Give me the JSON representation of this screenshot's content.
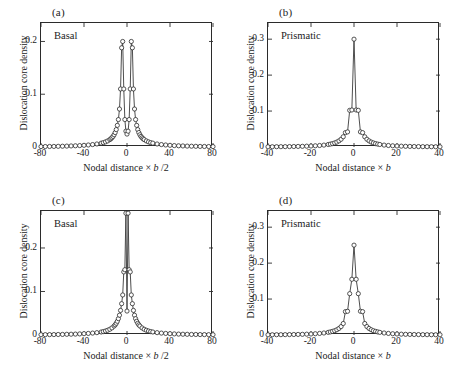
{
  "figure": {
    "background": "#ffffff",
    "line_color": "#3a3a3a",
    "marker_edge_color": "#2b2b2b",
    "marker_face_color": "#ffffff",
    "axis_color": "#2b2b2b"
  },
  "panels": [
    {
      "tag": "(a)",
      "inset_label": "Basal",
      "xlabel_prefix": "Nodal distance",
      "xlabel_times": "×",
      "xlabel_var": "b",
      "xlabel_suffix": "/2",
      "ylabel": "Dislocation core density",
      "xticks": [
        "-80",
        "-40",
        "0",
        "40",
        "80"
      ],
      "yticks": [
        "0",
        "0.1",
        "0.2"
      ]
    },
    {
      "tag": "(b)",
      "inset_label": "Prismatic",
      "xlabel_prefix": "Nodal distance",
      "xlabel_times": "×",
      "xlabel_var": "b",
      "xlabel_suffix": "",
      "ylabel": "Dislocation core density",
      "xticks": [
        "-40",
        "-20",
        "0",
        "20",
        "40"
      ],
      "yticks": [
        "0",
        "0.1",
        "0.2",
        "0.3"
      ]
    },
    {
      "tag": "(c)",
      "inset_label": "Basal",
      "xlabel_prefix": "Nodal distance",
      "xlabel_times": "×",
      "xlabel_var": "b",
      "xlabel_suffix": "/2",
      "ylabel": "Dislocation core density",
      "xticks": [
        "-80",
        "-40",
        "0",
        "40",
        "80"
      ],
      "yticks": [
        "0",
        "0.1",
        "0.2"
      ]
    },
    {
      "tag": "(d)",
      "inset_label": "Prismatic",
      "xlabel_prefix": "Nodal distance",
      "xlabel_times": "×",
      "xlabel_var": "b",
      "xlabel_suffix": "",
      "ylabel": "Dislocation core density",
      "xticks": [
        "-40",
        "-20",
        "0",
        "20",
        "40"
      ],
      "yticks": [
        "0",
        "0.1",
        "0.2",
        "0.3"
      ]
    }
  ],
  "caption_partial": "",
  "chart_data": [
    {
      "type": "line",
      "panel": "(a)",
      "title": "Basal",
      "xlabel": "Nodal distance × b /2",
      "ylabel": "Dislocation core density",
      "xlim": [
        -80,
        80
      ],
      "ylim": [
        0,
        0.235
      ],
      "xticks": [
        -80,
        -40,
        0,
        40,
        80
      ],
      "yticks": [
        0,
        0.1,
        0.2
      ],
      "grid": false,
      "legend": "none",
      "markers": "open-circle",
      "description": "Symmetric twin peaks near x = -5 and x = +5, each rising to about 0.20, with a shallow local minimum of about 0.025 at x = 0 and long flat tails near zero.",
      "x": [
        -80,
        -76,
        -72,
        -68,
        -64,
        -60,
        -56,
        -52,
        -48,
        -44,
        -40,
        -36,
        -32,
        -28,
        -24,
        -22,
        -20,
        -18,
        -16,
        -15,
        -14,
        -13,
        -12,
        -11,
        -10,
        -9,
        -8,
        -7,
        -6,
        -5,
        -4,
        -3,
        -2,
        -1,
        0,
        1,
        2,
        3,
        4,
        5,
        6,
        7,
        8,
        9,
        10,
        11,
        12,
        13,
        14,
        15,
        16,
        18,
        20,
        22,
        24,
        28,
        32,
        36,
        40,
        44,
        48,
        52,
        56,
        60,
        64,
        68,
        72,
        76,
        80
      ],
      "y": [
        0.0008,
        0.0009,
        0.001,
        0.0011,
        0.0013,
        0.0015,
        0.0017,
        0.002,
        0.0023,
        0.0027,
        0.0032,
        0.0038,
        0.0046,
        0.0057,
        0.0073,
        0.0083,
        0.0097,
        0.0115,
        0.014,
        0.0156,
        0.0176,
        0.02,
        0.0232,
        0.0274,
        0.033,
        0.041,
        0.052,
        0.072,
        0.11,
        0.188,
        0.2,
        0.11,
        0.052,
        0.03,
        0.0245,
        0.03,
        0.052,
        0.11,
        0.2,
        0.188,
        0.11,
        0.072,
        0.052,
        0.041,
        0.033,
        0.0274,
        0.0232,
        0.02,
        0.0176,
        0.0156,
        0.014,
        0.0115,
        0.0097,
        0.0083,
        0.0073,
        0.0057,
        0.0046,
        0.0038,
        0.0032,
        0.0027,
        0.0023,
        0.002,
        0.0017,
        0.0015,
        0.0013,
        0.0011,
        0.001,
        0.0009,
        0.0008
      ]
    },
    {
      "type": "line",
      "panel": "(b)",
      "title": "Prismatic",
      "xlabel": "Nodal distance × b",
      "ylabel": "Dislocation core density",
      "xlim": [
        -40,
        40
      ],
      "ylim": [
        0,
        0.345
      ],
      "xticks": [
        -40,
        -20,
        0,
        20,
        40
      ],
      "yticks": [
        0,
        0.1,
        0.2,
        0.3
      ],
      "grid": false,
      "legend": "none",
      "markers": "open-circle",
      "description": "Single very sharp symmetric peak centred at x = 0 reaching about 0.30 at the apex with paired markers near 0.275, dropping to about 0.10 at x = ±1 and long flat tails near zero.",
      "x": [
        -40,
        -38,
        -36,
        -34,
        -32,
        -30,
        -28,
        -26,
        -24,
        -22,
        -20,
        -18,
        -16,
        -14,
        -12,
        -11,
        -10,
        -9,
        -8,
        -7,
        -6,
        -5,
        -4,
        -3,
        -2,
        -1,
        0,
        1,
        2,
        3,
        4,
        5,
        6,
        7,
        8,
        9,
        10,
        11,
        12,
        14,
        16,
        18,
        20,
        22,
        24,
        26,
        28,
        30,
        32,
        34,
        36,
        38,
        40
      ],
      "y": [
        0.0006,
        0.0007,
        0.0008,
        0.0009,
        0.001,
        0.0012,
        0.0014,
        0.0016,
        0.0019,
        0.0023,
        0.0028,
        0.0034,
        0.0042,
        0.0053,
        0.007,
        0.0081,
        0.0095,
        0.0113,
        0.0137,
        0.017,
        0.0216,
        0.0285,
        0.04,
        0.042,
        0.102,
        0.103,
        0.3,
        0.103,
        0.102,
        0.042,
        0.04,
        0.0285,
        0.0216,
        0.017,
        0.0137,
        0.0113,
        0.0095,
        0.0081,
        0.007,
        0.0053,
        0.0042,
        0.0034,
        0.0028,
        0.0023,
        0.0019,
        0.0016,
        0.0014,
        0.0012,
        0.001,
        0.0009,
        0.0008,
        0.0007,
        0.0006
      ]
    },
    {
      "type": "line",
      "panel": "(c)",
      "title": "Basal",
      "xlabel": "Nodal distance × b /2",
      "ylabel": "Dislocation core density",
      "xlim": [
        -80,
        80
      ],
      "ylim": [
        0,
        0.285
      ],
      "xticks": [
        -80,
        -40,
        0,
        40,
        80
      ],
      "yticks": [
        0,
        0.1,
        0.2
      ],
      "grid": false,
      "legend": "none",
      "markers": "open-circle",
      "description": "Single tall narrow symmetric peak centred at x = 0 reaching about 0.28 at the top of the axis, with paired markers at about 0.15 and 0.09 on the flanks, a small dip to about 0.055 just at centre, and long flat tails.",
      "x": [
        -80,
        -76,
        -72,
        -68,
        -64,
        -60,
        -56,
        -52,
        -48,
        -44,
        -40,
        -36,
        -32,
        -28,
        -24,
        -22,
        -20,
        -18,
        -16,
        -14,
        -12,
        -11,
        -10,
        -9,
        -8,
        -7,
        -6,
        -5,
        -4,
        -3,
        -2,
        -1,
        0,
        1,
        2,
        3,
        4,
        5,
        6,
        7,
        8,
        9,
        10,
        11,
        12,
        14,
        16,
        18,
        20,
        22,
        24,
        28,
        32,
        36,
        40,
        44,
        48,
        52,
        56,
        60,
        64,
        68,
        72,
        76,
        80
      ],
      "y": [
        0.0007,
        0.0008,
        0.0009,
        0.001,
        0.0012,
        0.0013,
        0.0016,
        0.0018,
        0.0021,
        0.0025,
        0.003,
        0.0036,
        0.0044,
        0.0054,
        0.0069,
        0.0079,
        0.0092,
        0.0109,
        0.0132,
        0.0163,
        0.0206,
        0.0234,
        0.027,
        0.0315,
        0.0375,
        0.0455,
        0.0565,
        0.072,
        0.092,
        0.145,
        0.15,
        0.28,
        0.055,
        0.28,
        0.15,
        0.145,
        0.092,
        0.072,
        0.0565,
        0.0455,
        0.0375,
        0.0315,
        0.027,
        0.0234,
        0.0206,
        0.0163,
        0.0132,
        0.0109,
        0.0092,
        0.0079,
        0.0069,
        0.0054,
        0.0044,
        0.0036,
        0.003,
        0.0025,
        0.0021,
        0.0018,
        0.0016,
        0.0013,
        0.0012,
        0.001,
        0.0009,
        0.0008,
        0.0007
      ]
    },
    {
      "type": "line",
      "panel": "(d)",
      "title": "Prismatic",
      "xlabel": "Nodal distance × b",
      "ylabel": "Dislocation core density",
      "xlim": [
        -40,
        40
      ],
      "ylim": [
        0,
        0.345
      ],
      "xticks": [
        -40,
        -20,
        0,
        20,
        40
      ],
      "yticks": [
        0,
        0.1,
        0.2,
        0.3
      ],
      "grid": false,
      "legend": "none",
      "markers": "open-circle",
      "description": "Single symmetric peak centred at x = 0 rising to about 0.25 with a short flat crest, paired markers near 0.185, 0.155, 0.115 and 0.065 down the flanks, and long flat tails near zero.",
      "x": [
        -40,
        -38,
        -36,
        -34,
        -32,
        -30,
        -28,
        -26,
        -24,
        -22,
        -20,
        -18,
        -16,
        -14,
        -12,
        -11,
        -10,
        -9,
        -8,
        -7,
        -6,
        -5,
        -4,
        -3,
        -2,
        -1,
        0,
        1,
        2,
        3,
        4,
        5,
        6,
        7,
        8,
        9,
        10,
        11,
        12,
        14,
        16,
        18,
        20,
        22,
        24,
        26,
        28,
        30,
        32,
        34,
        36,
        38,
        40
      ],
      "y": [
        0.0006,
        0.0007,
        0.0008,
        0.0009,
        0.001,
        0.0012,
        0.0014,
        0.0016,
        0.0019,
        0.0023,
        0.0028,
        0.0035,
        0.0044,
        0.0056,
        0.0074,
        0.0086,
        0.0101,
        0.012,
        0.0146,
        0.0182,
        0.0235,
        0.032,
        0.065,
        0.066,
        0.115,
        0.155,
        0.25,
        0.155,
        0.115,
        0.066,
        0.065,
        0.032,
        0.0235,
        0.0182,
        0.0146,
        0.012,
        0.0101,
        0.0086,
        0.0074,
        0.0056,
        0.0044,
        0.0035,
        0.0028,
        0.0023,
        0.0019,
        0.0016,
        0.0014,
        0.0012,
        0.001,
        0.0009,
        0.0008,
        0.0007,
        0.0006
      ]
    }
  ]
}
